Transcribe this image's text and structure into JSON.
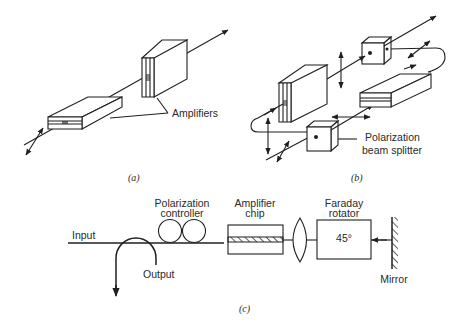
{
  "figure": {
    "panels": [
      {
        "id": "a",
        "caption": "(a)",
        "labels": {
          "amplifiers": "Amplifiers"
        }
      },
      {
        "id": "b",
        "caption": "(b)",
        "labels": {
          "splitter_line1": "Polarization",
          "splitter_line2": "beam splitter"
        }
      },
      {
        "id": "c",
        "caption": "(c)",
        "labels": {
          "input": "Input",
          "output": "Output",
          "pol_controller_line1": "Polarization",
          "pol_controller_line2": "controller",
          "amp_chip_line1": "Amplifier",
          "amp_chip_line2": "chip",
          "faraday_line1": "Faraday",
          "faraday_line2": "rotator",
          "rotation_angle": "45°",
          "mirror": "Mirror"
        }
      }
    ]
  },
  "colors": {
    "ink": "#1f1f1f",
    "background": "#ffffff"
  }
}
